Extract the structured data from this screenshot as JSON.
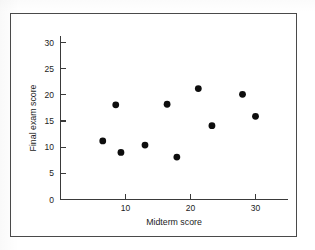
{
  "chart_data": {
    "type": "scatter",
    "title": "",
    "xlabel": "Midterm score",
    "ylabel": "Final exam score",
    "xlim": [
      0,
      35
    ],
    "ylim": [
      0,
      32
    ],
    "xticks": [
      10,
      20,
      30
    ],
    "yticks": [
      0,
      5,
      10,
      15,
      20,
      25,
      30
    ],
    "grid": false,
    "legend": null,
    "marker": "filled-circle",
    "marker_color": "#0d0d0d",
    "points": [
      {
        "x": 6.5,
        "y": 11.2
      },
      {
        "x": 8.5,
        "y": 18.1
      },
      {
        "x": 9.3,
        "y": 9.0
      },
      {
        "x": 13.0,
        "y": 10.4
      },
      {
        "x": 16.4,
        "y": 18.2
      },
      {
        "x": 17.9,
        "y": 8.1
      },
      {
        "x": 21.2,
        "y": 21.2
      },
      {
        "x": 23.3,
        "y": 14.1
      },
      {
        "x": 28.0,
        "y": 20.1
      },
      {
        "x": 30.0,
        "y": 15.9
      }
    ]
  },
  "axes": {
    "x_tick_labels": [
      "10",
      "20",
      "30"
    ],
    "y_tick_labels": [
      "0",
      "5",
      "10",
      "15",
      "20",
      "25",
      "30"
    ],
    "x_axis_title": "Midterm score",
    "y_axis_title": "Final exam score"
  }
}
